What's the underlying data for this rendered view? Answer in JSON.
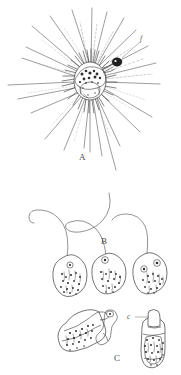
{
  "figure": {
    "background_color": "#ffffff",
    "ink_color": "#3a3a3a",
    "width": 181,
    "height": 375
  },
  "labels": {
    "panel_a": "A",
    "panel_b": "B",
    "panel_c": "C",
    "callout_f": "f",
    "callout_c": "c"
  },
  "panels": [
    {
      "id": "A",
      "label": "A",
      "name": "heliozoan-with-axopodia",
      "description": "Spherical cell body with granular cytoplasm and numerous straight radiating axopodia; a small dark attached organism at upper right labelled f",
      "callouts": [
        "f"
      ],
      "bounds": {
        "x": 0,
        "y": 0,
        "width": 181,
        "height": 180
      }
    },
    {
      "id": "B",
      "label": "B",
      "name": "flagellated-cells-row",
      "description": "Three pear-shaped flagellate cells with long sinuous flagella trailing upward; each cell has a nucleus and granular inclusions",
      "cell_count": 3,
      "bounds": {
        "x": 0,
        "y": 180,
        "width": 181,
        "height": 115
      }
    },
    {
      "id": "C",
      "label": "C",
      "name": "loricate-cells-pair",
      "description": "Two cells: left one tilted with a cup-shaped test and a looped stalk structure; right one upright within a lorica, with collar labelled c",
      "cell_count": 2,
      "callouts": [
        "c"
      ],
      "bounds": {
        "x": 0,
        "y": 295,
        "width": 181,
        "height": 80
      }
    }
  ]
}
